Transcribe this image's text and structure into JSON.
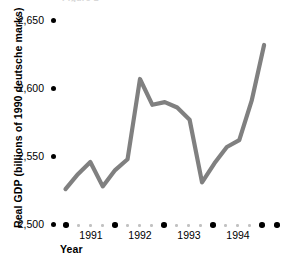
{
  "figure": {
    "clipped_top_text": "Figure 1",
    "line_color": "#808080",
    "axis_dot_color": "#000000",
    "minor_dot_color": "#c2c2c2"
  },
  "chart_data": {
    "type": "line",
    "title": "",
    "xlabel": "Year",
    "ylabel": "Real GDP (billions of 1990 deutsche marks)",
    "ylim": [
      2500,
      2665
    ],
    "xlim": [
      1990.75,
      1995.0
    ],
    "yticks": [
      2500,
      2550,
      2600,
      2650
    ],
    "ytick_labels": [
      "2,500",
      "2,550",
      "2,600",
      "2,650"
    ],
    "xticks": [
      1991,
      1992,
      1993,
      1994
    ],
    "xtick_labels": [
      "1991",
      "1992",
      "1993",
      "1994"
    ],
    "grid": false,
    "legend": null,
    "x": [
      1990.75,
      1991.0,
      1991.25,
      1991.5,
      1991.75,
      1992.0,
      1992.25,
      1992.5,
      1992.75,
      1993.0,
      1993.25,
      1993.5,
      1993.75,
      1994.0,
      1994.25,
      1994.5,
      1994.75
    ],
    "values": [
      2526,
      2537,
      2546,
      2528,
      2540,
      2548,
      2607,
      2588,
      2590,
      2586,
      2577,
      2531,
      2545,
      2557,
      2562,
      2591,
      2632
    ],
    "series": [
      {
        "name": "Real GDP",
        "values": [
          2526,
          2537,
          2546,
          2528,
          2540,
          2548,
          2607,
          2588,
          2590,
          2586,
          2577,
          2531,
          2545,
          2557,
          2562,
          2591,
          2632
        ]
      }
    ]
  },
  "axis_markers": {
    "x_major_years": [
      "1990",
      "1991",
      "1992",
      "1993",
      "1994",
      "1995"
    ],
    "minor_per_interval": 3
  }
}
